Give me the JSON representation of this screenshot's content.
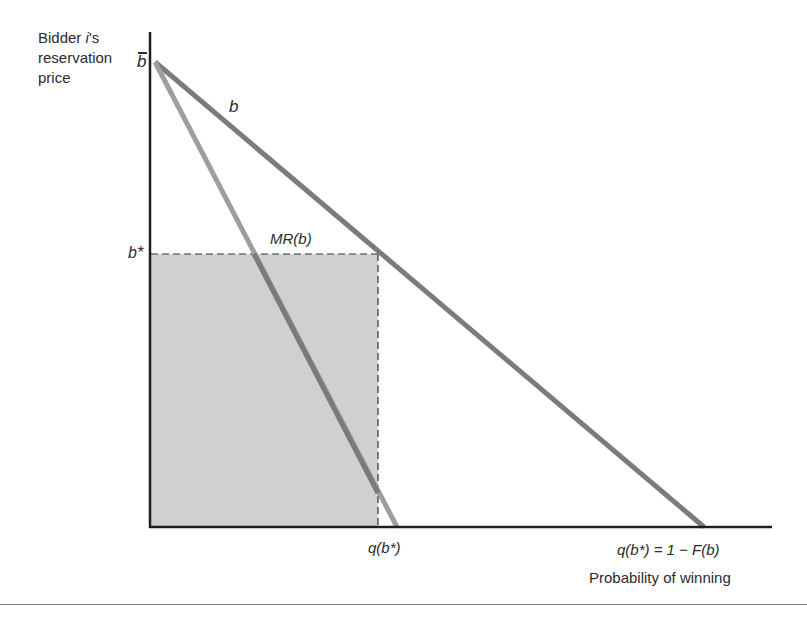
{
  "diagram": {
    "type": "economics-auction-diagram",
    "y_axis_label_lines": [
      "Bidder ",
      "i",
      "'s",
      "reservation",
      "price"
    ],
    "y_axis_label": {
      "line1_prefix": "Bidder ",
      "line1_italic": "i",
      "line1_suffix": "'s",
      "line2": "reservation",
      "line3": "price"
    },
    "y_ticks": {
      "b_bar": "b",
      "b_star": "b*"
    },
    "curve_labels": {
      "demand": "b",
      "marginal_revenue": "MR(b)"
    },
    "x_ticks": {
      "q_b_star": "q(b*)",
      "q_full": "q(b*) = 1 − F(b)"
    },
    "x_axis_label": "Probability of winning",
    "colors": {
      "axis": "#1e1e1e",
      "demand_line": "#7b7b7b",
      "mr_line": "#9e9e9e",
      "shaded_region": "#d0d0d0",
      "dashed": "#333333"
    },
    "geometry": {
      "origin": [
        150,
        527
      ],
      "y_axis_top": 32,
      "x_axis_right": 772,
      "b_bar_point": [
        155,
        62
      ],
      "demand_x_intercept": [
        704,
        527
      ],
      "mr_x_intercept": [
        397,
        527
      ],
      "b_star_y": 254,
      "q_b_star_x": 378,
      "demand_at_b_star": [
        380,
        254
      ]
    }
  }
}
